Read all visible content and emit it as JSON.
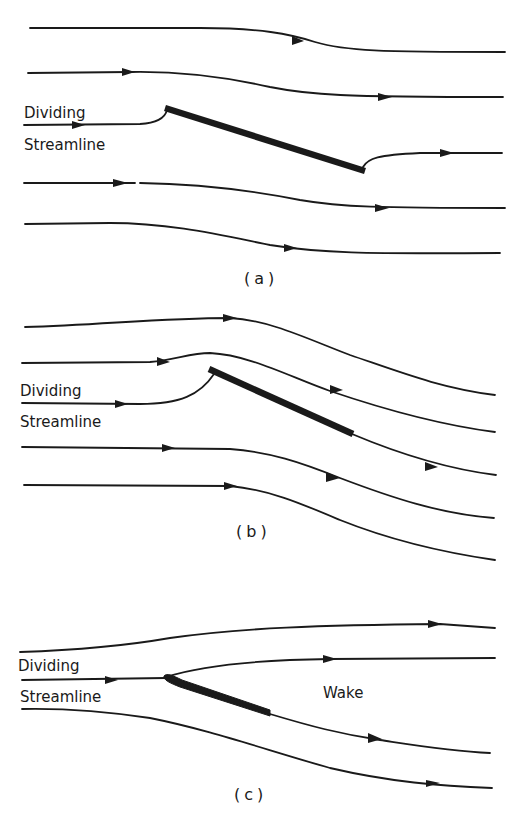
{
  "figure": {
    "panels": [
      {
        "id": "a",
        "caption": "(a)",
        "labels": {
          "dividing_line1": "Dividing",
          "dividing_line2": "Streamline"
        }
      },
      {
        "id": "b",
        "caption": "(b)",
        "labels": {
          "dividing_line1": "Dividing",
          "dividing_line2": "Streamline"
        }
      },
      {
        "id": "c",
        "caption": "(c)",
        "labels": {
          "dividing_line1": "Dividing",
          "dividing_line2": "Streamline",
          "wake": "Wake"
        }
      }
    ],
    "colors": {
      "ink": "#1a1a1a",
      "background": "#ffffff"
    }
  }
}
